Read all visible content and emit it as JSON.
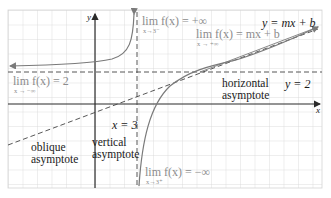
{
  "diagram": {
    "title": "",
    "axes": {
      "x_label": "x",
      "y_label": "y"
    },
    "colors": {
      "grid": "#d4d4d4",
      "axis": "#2a2a2a",
      "curve": "#7a7a7a",
      "asymptote": "#444444",
      "gray_text": "#8c8c8c",
      "dark_text": "#1a1a1a"
    },
    "labels": {
      "lim_left": {
        "main": "lim f(x) = 2",
        "sub": "x → −∞"
      },
      "lim_top_vertical": {
        "main": "lim f(x) = +∞",
        "sub": "x→3⁻"
      },
      "lim_right_oblique": {
        "main": "lim f(x) = mx + b",
        "sub": "x → +∞"
      },
      "lim_bottom_vertical": {
        "main": "lim f(x) = −∞",
        "sub": "x→3⁺"
      },
      "oblique_eq": "y = mx + b",
      "horizontal_eq": "y = 2",
      "vertical_eq": "x = 3",
      "horizontal_asymptote": [
        "horizontal",
        "asymptote"
      ],
      "vertical_asymptote": [
        "vertical",
        "asymptote"
      ],
      "oblique_asymptote": [
        "oblique",
        "asymptote"
      ]
    }
  }
}
